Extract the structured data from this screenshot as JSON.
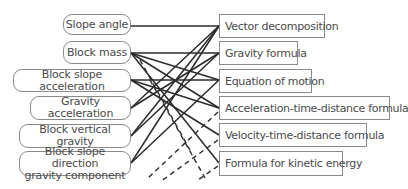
{
  "diagram": {
    "left_nodes": [
      {
        "id": "slope_angle",
        "label": "Slope angle"
      },
      {
        "id": "block_mass",
        "label": "Block mass"
      },
      {
        "id": "block_slope_acceleration",
        "label": "Block slope acceleration"
      },
      {
        "id": "gravity_acceleration",
        "label": "Gravity acceleration"
      },
      {
        "id": "block_vertical_gravity",
        "label": "Block vertical gravity"
      },
      {
        "id": "block_slope_direction_gravity_component",
        "label": "Block slope direction gravity component",
        "line1": "Block slope direction",
        "line2": "gravity component"
      }
    ],
    "right_nodes": [
      {
        "id": "vector_decomposition",
        "label": "Vector decomposition"
      },
      {
        "id": "gravity_formula",
        "label": "Gravity formula"
      },
      {
        "id": "equation_of_motion",
        "label": "Equation of motion"
      },
      {
        "id": "acceleration_time_distance_formula",
        "label": "Acceleration-time-distance formula"
      },
      {
        "id": "velocity_time_distance_formula",
        "label": "Velocity-time-distance formula"
      },
      {
        "id": "formula_for_kinetic_energy",
        "label": "Formula for kinetic energy"
      }
    ],
    "colors": {
      "line": "#2b2b2b",
      "border": "#8a8a8a",
      "text": "#4a4a4a"
    }
  }
}
